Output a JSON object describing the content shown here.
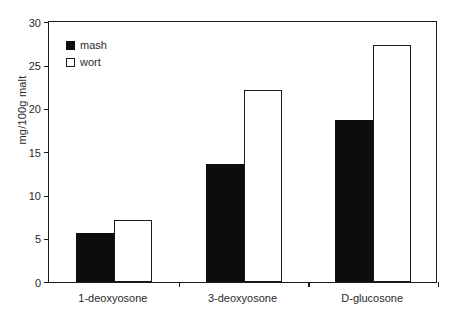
{
  "chart_data": {
    "type": "bar",
    "title": "",
    "subtitle": "",
    "xlabel": "",
    "ylabel": "mg/100g malt",
    "categories": [
      "1-deoxyosone",
      "3-deoxyosone",
      "D-glucosone"
    ],
    "series": [
      {
        "name": "mash",
        "values": [
          5.6,
          13.6,
          18.7
        ],
        "color": "#0d0d0d",
        "style": "filled"
      },
      {
        "name": "wort",
        "values": [
          7.1,
          22.1,
          27.4
        ],
        "color": "#ffffff",
        "style": "hollow-black-outline"
      }
    ],
    "ylim": [
      0,
      30
    ],
    "yticks": [
      0,
      5,
      10,
      15,
      20,
      25,
      30
    ],
    "ytick_labels": [
      "0",
      "5",
      "10",
      "15",
      "20",
      "25",
      "30"
    ],
    "grid": false,
    "legend_position": "top-left",
    "axis_color": "#1a1a1a",
    "background": "#ffffff"
  },
  "legend": {
    "items": [
      {
        "label": "mash",
        "swatch": "filled-square"
      },
      {
        "label": "wort",
        "swatch": "hollow-square"
      }
    ]
  }
}
